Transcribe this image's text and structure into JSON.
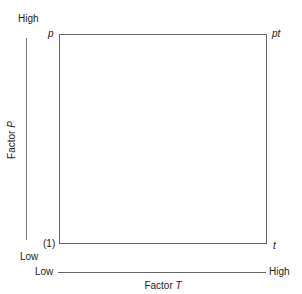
{
  "diagram": {
    "type": "2x2 factorial design square",
    "corners": {
      "top_left": "p",
      "top_right": "pt",
      "bottom_left": "(1)",
      "bottom_right": "t"
    },
    "vertical_axis": {
      "label_prefix": "Factor ",
      "label_var": "P",
      "high": "High",
      "low": "Low"
    },
    "horizontal_axis": {
      "label_prefix": "Factor ",
      "label_var": "T",
      "low": "Low",
      "high": "High"
    },
    "colors": {
      "line": "#666666",
      "text": "#222222"
    }
  }
}
